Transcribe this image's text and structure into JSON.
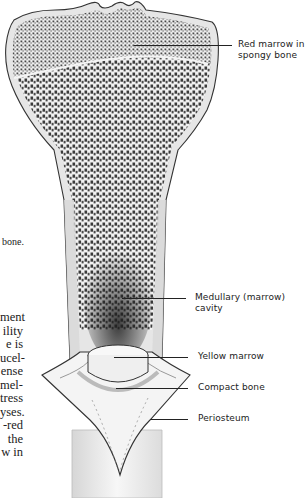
{
  "figure": {
    "labels": {
      "red_marrow": [
        "Red marrow in",
        "spongy bone"
      ],
      "medullary": [
        "Medullary (marrow)",
        "cavity"
      ],
      "yellow_marrow": "Yellow marrow",
      "compact_bone": "Compact bone",
      "periosteum": "Periosteum"
    }
  },
  "body_text_fragments": {
    "caption_tail": "bone.",
    "lines": [
      "ment",
      "ility",
      "e  is",
      "ucel-",
      "ense",
      "mel-",
      "tress",
      "yses.",
      "-red",
      "the",
      "w  in"
    ]
  }
}
